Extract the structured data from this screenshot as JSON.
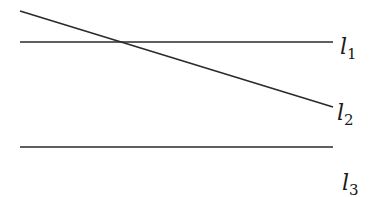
{
  "diagram": {
    "lines": [
      {
        "name": "l1",
        "x1": 20,
        "y1": 42,
        "x2": 333,
        "y2": 42,
        "label_main": "l",
        "label_sub": "1",
        "label_x": 340,
        "label_y": 56
      },
      {
        "name": "l2",
        "x1": 20,
        "y1": 11,
        "x2": 333,
        "y2": 107,
        "label_main": "l",
        "label_sub": "2",
        "label_x": 338,
        "label_y": 122
      },
      {
        "name": "l3",
        "x1": 20,
        "y1": 147,
        "x2": 333,
        "y2": 147,
        "label_main": "l",
        "label_sub": "3",
        "label_x": 342,
        "label_y": 193
      }
    ],
    "stroke_color": "#2a2a2a"
  }
}
